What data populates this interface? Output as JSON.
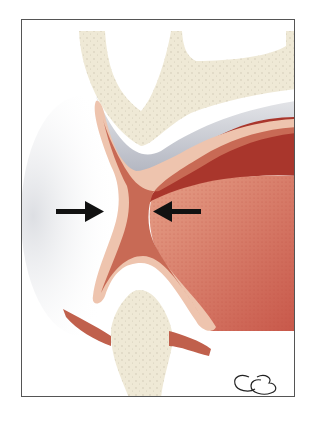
{
  "figure": {
    "type": "anatomical illustration",
    "signature": "CB",
    "arrows": [
      {
        "direction": "right",
        "label": "left-compression-arrow"
      },
      {
        "direction": "left",
        "label": "right-compression-arrow"
      }
    ],
    "colors": {
      "bone": "#efe9d6",
      "bone_dots": "#c9c2ad",
      "periosteum_gray": "#b9bcc6",
      "mucosa_light": "#eec4ae",
      "muscle_dark": "#a9362c",
      "muscle_mid": "#c0604c",
      "tissue": "#d9826a",
      "arrow": "#111111",
      "frame": "#555555"
    }
  }
}
